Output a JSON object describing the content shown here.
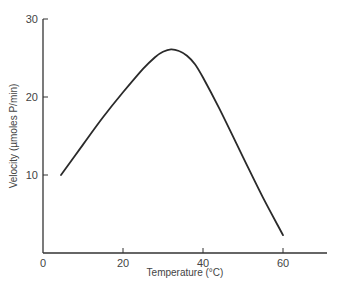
{
  "chart_data": {
    "type": "line",
    "title": "",
    "xlabel": "Temperature (°C)",
    "ylabel": "Velocity (µmoles P/min)",
    "xlim": [
      0,
      71
    ],
    "ylim": [
      0,
      30
    ],
    "xticks": [
      0,
      20,
      40,
      60
    ],
    "yticks": [
      10,
      20,
      30
    ],
    "grid": false,
    "legend": null,
    "series": [
      {
        "name": "Velocity",
        "x": [
          4.5,
          10,
          15,
          20,
          25,
          28,
          30,
          32,
          34,
          36,
          38,
          40,
          44,
          50,
          55,
          60
        ],
        "y": [
          10.0,
          13.9,
          17.4,
          20.6,
          23.6,
          25.1,
          25.8,
          26.1,
          25.9,
          25.3,
          24.2,
          22.5,
          18.6,
          12.3,
          7.1,
          2.3
        ]
      }
    ]
  },
  "labels": {
    "x_title": "Temperature (°C)",
    "y_title": "Velocity (µmoles P/min)",
    "x_ticks": [
      "0",
      "20",
      "40",
      "60"
    ],
    "y_ticks": [
      "10",
      "20",
      "30"
    ]
  }
}
